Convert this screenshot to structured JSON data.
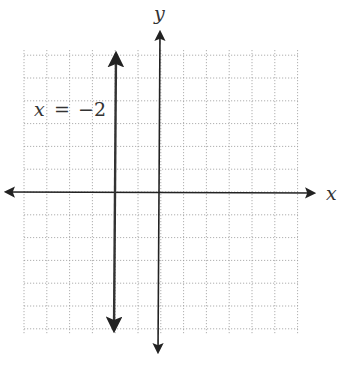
{
  "chart_data": {
    "type": "line",
    "title": "",
    "xlabel": "x",
    "ylabel": "y",
    "xlim": [
      -6,
      6
    ],
    "ylim": [
      -6.3,
      6.3
    ],
    "grid": true,
    "grid_style": "dotted",
    "series": [
      {
        "name": "x = -2",
        "type": "vertical_line",
        "x": -2,
        "y_range": [
          -6.3,
          6.3
        ],
        "arrows": "both"
      }
    ],
    "annotations": [
      {
        "text": "x =  −2",
        "x": -5.5,
        "y": 4.5
      }
    ]
  },
  "labels": {
    "x_axis": "x",
    "y_axis": "y",
    "line_label_lhs": "x",
    "line_label_eq": "=",
    "line_label_rhs": "−2"
  },
  "colors": {
    "axis": "#222222",
    "line": "#333333",
    "grid": "#9a9a9a"
  }
}
